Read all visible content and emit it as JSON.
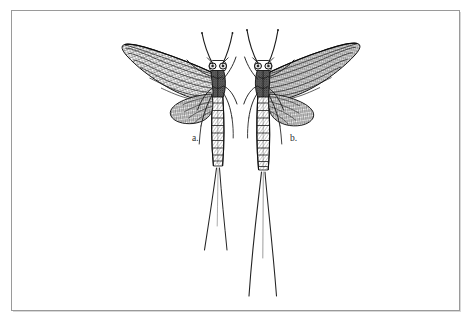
{
  "plate": {
    "kind": "engraving",
    "subject": "mayflies",
    "background_color": "#ffffff",
    "ink_color": "#1d1d1d",
    "frame": {
      "name": "plate-rule",
      "border_color": "#9a9a9a",
      "shadow_color": "#d8d8d8",
      "x": 11,
      "y": 10,
      "width": 449,
      "height": 301
    },
    "figures": [
      {
        "id": "a",
        "label": "a.",
        "label_x": 192,
        "label_y": 141,
        "orientation": "wings-to-left",
        "description": "mayfly, dorsal view, wings spread to the left"
      },
      {
        "id": "b",
        "label": "b.",
        "label_x": 290,
        "label_y": 141,
        "orientation": "wings-to-right",
        "description": "mayfly, dorsal view, wings spread to the right"
      }
    ]
  }
}
